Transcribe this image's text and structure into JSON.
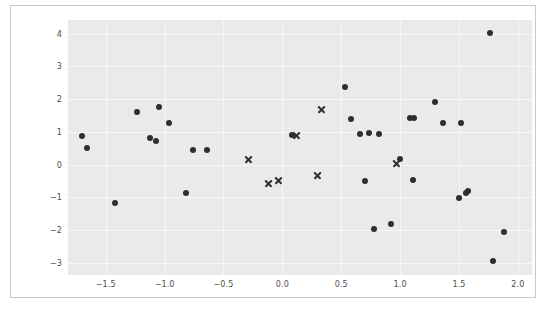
{
  "figure": {
    "background_color": "#ffffff",
    "frame_border_color": "#c9c9c9"
  },
  "chart_data": {
    "type": "scatter",
    "title": "",
    "subtitle": "",
    "xlabel": "",
    "ylabel": "",
    "xlim": [
      -1.82,
      2.12
    ],
    "ylim": [
      -3.38,
      4.42
    ],
    "grid": true,
    "grid_color": "#f7f7f7",
    "plot_background": "#eaeaea",
    "legend": null,
    "legend_position": "none",
    "xticks": [
      -1.5,
      -1.0,
      -0.5,
      0.0,
      0.5,
      1.0,
      1.5,
      2.0
    ],
    "xticklabels": [
      "−1.5",
      "−1.0",
      "−0.5",
      "0.0",
      "0.5",
      "1.0",
      "1.5",
      "2.0"
    ],
    "yticks": [
      4,
      3,
      2,
      1,
      0,
      -1,
      -2,
      -3
    ],
    "yticklabels": [
      "4",
      "3",
      "2",
      "1",
      "0",
      "−1",
      "−2",
      "−3"
    ],
    "series": [
      {
        "name": "points",
        "marker": "circle",
        "color": "#2f2f32",
        "size": 6,
        "x": [
          -1.7,
          -1.66,
          -1.42,
          -1.23,
          -1.12,
          -1.07,
          -1.05,
          -0.96,
          -0.82,
          -0.76,
          -0.64,
          0.08,
          0.53,
          0.58,
          0.66,
          0.7,
          0.74,
          0.78,
          0.82,
          0.92,
          1.0,
          1.08,
          1.11,
          1.12,
          1.3,
          1.36,
          1.5,
          1.52,
          1.56,
          1.58,
          1.76,
          1.79,
          1.88
        ],
        "y": [
          0.88,
          0.5,
          -1.18,
          1.61,
          0.8,
          0.72,
          1.76,
          1.27,
          -0.88,
          0.45,
          0.45,
          0.9,
          2.38,
          1.4,
          0.93,
          -0.5,
          0.97,
          -1.98,
          0.93,
          -1.83,
          0.18,
          1.43,
          -0.46,
          1.43,
          1.92,
          1.28,
          -1.02,
          1.28,
          -0.88,
          -0.8,
          4.02,
          -2.96,
          -2.05
        ]
      },
      {
        "name": "crosses",
        "marker": "x",
        "color": "#2f2f32",
        "size": 9,
        "x": [
          -0.29,
          -0.12,
          -0.03,
          0.12,
          0.3,
          0.33,
          0.97
        ],
        "y": [
          0.16,
          -0.58,
          -0.5,
          0.9,
          -0.33,
          1.68,
          0.04
        ]
      }
    ]
  }
}
